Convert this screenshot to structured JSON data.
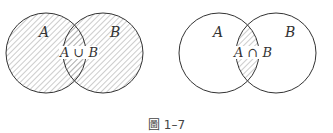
{
  "figure": {
    "caption": "圖 1–7",
    "line_color": "#333333",
    "hatch_color": "#9a9a9a",
    "diagrams": [
      {
        "name": "union",
        "label_a": "A",
        "label_b": "B",
        "operation_label": "A ∪ B",
        "shaded_region": "A union B"
      },
      {
        "name": "intersection",
        "label_a": "A",
        "label_b": "B",
        "operation_label": "A ∩ B",
        "shaded_region": "A intersection B"
      }
    ]
  }
}
